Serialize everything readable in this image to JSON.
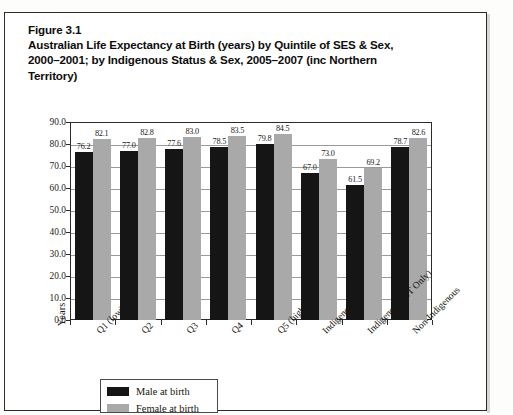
{
  "document": {
    "figure_number": "Figure 3.1",
    "title_lines": [
      "Australian Life Expectancy at Birth (years) by Quintile of SES & Sex,",
      "2000–2001; by Indigenous Status & Sex, 2005–2007 (inc Northern",
      "Territory)"
    ]
  },
  "chart_data": {
    "type": "bar",
    "title": "Australian Life Expectancy at Birth (years) by Quintile of SES & Sex, 2000–2001; by Indigenous Status & Sex, 2005–2007 (inc Northern Territory)",
    "xlabel": "",
    "ylabel": "Years",
    "ylim": [
      0.0,
      90.0
    ],
    "ytick_labels": [
      "90.0",
      "80.0",
      "70.0",
      "60.0",
      "50.0",
      "40.0",
      "30.0",
      "20.0",
      "10.0",
      "0.0"
    ],
    "ytick_values": [
      90.0,
      80.0,
      70.0,
      60.0,
      50.0,
      40.0,
      30.0,
      20.0,
      10.0,
      0.0
    ],
    "grid": true,
    "legend_position": "bottom-left",
    "categories": [
      "Q1 (low)",
      "Q2",
      "Q3",
      "Q4",
      "Q5 (high)",
      "Indigenous",
      "Indigenous (NT Only)",
      "Non-Indigenous"
    ],
    "series": [
      {
        "name": "Male at birth",
        "color": "#151515",
        "values": [
          76.2,
          77.0,
          77.6,
          78.5,
          79.8,
          67.0,
          61.5,
          78.7
        ]
      },
      {
        "name": "Female at birth",
        "color": "#a9a9a9",
        "values": [
          82.1,
          82.8,
          83.0,
          83.5,
          84.5,
          73.0,
          69.2,
          82.6
        ]
      }
    ]
  },
  "legend": {
    "entries": [
      {
        "label": "Male at birth",
        "swatch": "male"
      },
      {
        "label": "Female at birth",
        "swatch": "female"
      }
    ]
  }
}
